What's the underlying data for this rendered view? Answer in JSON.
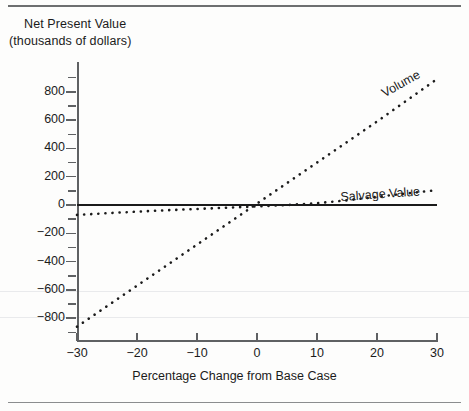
{
  "figure": {
    "y_axis_title_line1": "Net Present Value",
    "y_axis_title_line2": "(thousands of dollars)",
    "x_axis_title": "Percentage Change from Base Case"
  },
  "chart_data": {
    "type": "line",
    "title": "",
    "xlabel": "Percentage Change from Base Case",
    "ylabel": "Net Present Value (thousands of dollars)",
    "xlim": [
      -30,
      30
    ],
    "ylim": [
      -900,
      950
    ],
    "xticks": [
      -30,
      -20,
      -10,
      0,
      10,
      20,
      30
    ],
    "xtick_labels": [
      "-30",
      "-20",
      "-10",
      "0",
      "10",
      "20",
      "30"
    ],
    "yticks": [
      -800,
      -600,
      -400,
      -200,
      0,
      200,
      400,
      600,
      800
    ],
    "ytick_labels": [
      "-800",
      "-600",
      "-400",
      "-200",
      "0",
      "200",
      "400",
      "600",
      "800"
    ],
    "yticks_minor": [
      -900,
      -700,
      -500,
      -300,
      -100,
      100,
      300,
      500,
      700,
      900
    ],
    "grid": false,
    "legend": "inline-labels",
    "x": [
      -30,
      -25,
      -20,
      -15,
      -10,
      -5,
      0,
      5,
      10,
      15,
      20,
      25,
      30
    ],
    "series": [
      {
        "name": "Volume",
        "style": "dotted",
        "color": "#1b1b1b",
        "label_position": "upper-right-along-line",
        "values": [
          -860,
          -715,
          -570,
          -425,
          -280,
          -135,
          10,
          155,
          300,
          445,
          590,
          740,
          890
        ]
      },
      {
        "name": "Salvage Value",
        "style": "dotted",
        "color": "#1b1b1b",
        "label_position": "right-above-line",
        "values": [
          -70,
          -58,
          -47,
          -37,
          -28,
          -19,
          -10,
          0,
          13,
          33,
          58,
          82,
          105
        ]
      },
      {
        "name": "Zero Reference",
        "style": "solid",
        "color": "#1b1b1b",
        "values": [
          0,
          0,
          0,
          0,
          0,
          0,
          0,
          0,
          0,
          0,
          0,
          0,
          0
        ]
      }
    ]
  }
}
